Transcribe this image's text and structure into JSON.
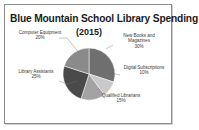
{
  "frame": {
    "border_color": "#8d8d8d"
  },
  "chart_data": {
    "type": "pie",
    "title": "Blue Mountain School Library Spending",
    "subtitle": "(2015)",
    "xlabel": "",
    "ylabel": "",
    "grid": false,
    "legend_position": "outside-labels",
    "units": "percent",
    "start_angle_deg": 0,
    "direction": "clockwise",
    "categories": [
      "New Books and Magazines",
      "Digital Subscriptions",
      "Qualified Librarians",
      "Library Assistants",
      "Computer Equipment"
    ],
    "values": [
      30,
      10,
      15,
      25,
      20
    ],
    "labels": [
      "New Books and\nMagazines",
      "Digital\nSubscriptions",
      "Qualified\nLibrarians",
      "Library\nAssistants",
      "Computer\nEquipment"
    ],
    "value_labels": [
      "30%",
      "10%",
      "15%",
      "25%",
      "20%"
    ],
    "colors": [
      "#6f6f6f",
      "#c9c9c9",
      "#a3a3a3",
      "#4a4a4a",
      "#8a8a8a"
    ],
    "slices": [
      {
        "name": "New Books and Magazines",
        "value": 30,
        "label": "30%",
        "color": "#6f6f6f"
      },
      {
        "name": "Digital Subscriptions",
        "value": 10,
        "label": "10%",
        "color": "#c9c9c9"
      },
      {
        "name": "Qualified Librarians",
        "value": 15,
        "label": "15%",
        "color": "#a3a3a3"
      },
      {
        "name": "Library Assistants",
        "value": 25,
        "label": "25%",
        "color": "#4a4a4a"
      },
      {
        "name": "Computer Equipment",
        "value": 20,
        "label": "20%",
        "color": "#8a8a8a"
      }
    ]
  },
  "labels": {
    "computer": {
      "line1": "Computer",
      "line2": "Equipment",
      "pct": "20%"
    },
    "newbooks": {
      "line1": "New Books and",
      "line2": "Magazines",
      "pct": "30%"
    },
    "digital": {
      "line1": "Digital",
      "line2": "Subscriptions",
      "pct": "10%"
    },
    "qualified": {
      "line1": "Qualified",
      "line2": "Librarians",
      "pct": "15%"
    },
    "library": {
      "line1": "Library",
      "line2": "Assistants",
      "pct": "25%"
    }
  }
}
